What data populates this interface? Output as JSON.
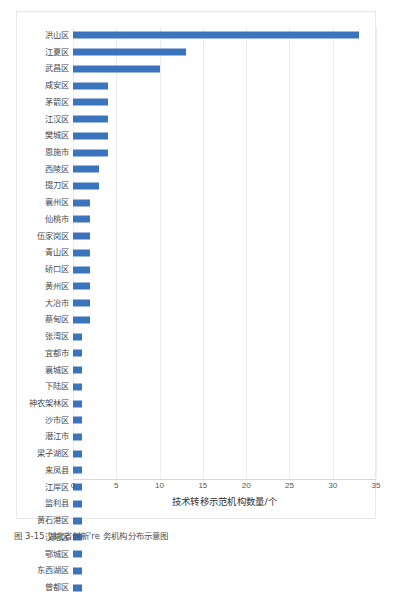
{
  "figure": {
    "caption": "图 3-15  湖北省创新're 务机构分布示意图"
  },
  "chart_data": {
    "type": "bar",
    "orientation": "horizontal",
    "title": "",
    "xlabel": "技术转移示范机构数量/个",
    "ylabel": "",
    "xlim": [
      0,
      35
    ],
    "xticks": [
      0,
      5,
      10,
      15,
      20,
      25,
      30,
      35
    ],
    "grid": true,
    "grid_axis": "x",
    "legend": null,
    "bar_color": "#3b74bd",
    "categories": [
      "洪山区",
      "江夏区",
      "武昌区",
      "咸安区",
      "茅箭区",
      "江汉区",
      "樊城区",
      "恩施市",
      "西陵区",
      "掇刀区",
      "襄州区",
      "仙桃市",
      "伍家岗区",
      "青山区",
      "硚口区",
      "黄州区",
      "大冶市",
      "蔡甸区",
      "张湾区",
      "宜都市",
      "襄城区",
      "下陆区",
      "神农架林区",
      "沙市区",
      "潜江市",
      "梁子湖区",
      "来凤县",
      "江岸区",
      "监利县",
      "黄石港区",
      "汉阳区",
      "鄂城区",
      "东西湖区",
      "曾都区"
    ],
    "values": [
      33,
      13,
      10,
      4,
      4,
      4,
      4,
      4,
      3,
      3,
      2,
      2,
      2,
      2,
      2,
      2,
      2,
      2,
      1,
      1,
      1,
      1,
      1,
      1,
      1,
      1,
      1,
      1,
      1,
      1,
      1,
      1,
      1,
      1
    ]
  }
}
